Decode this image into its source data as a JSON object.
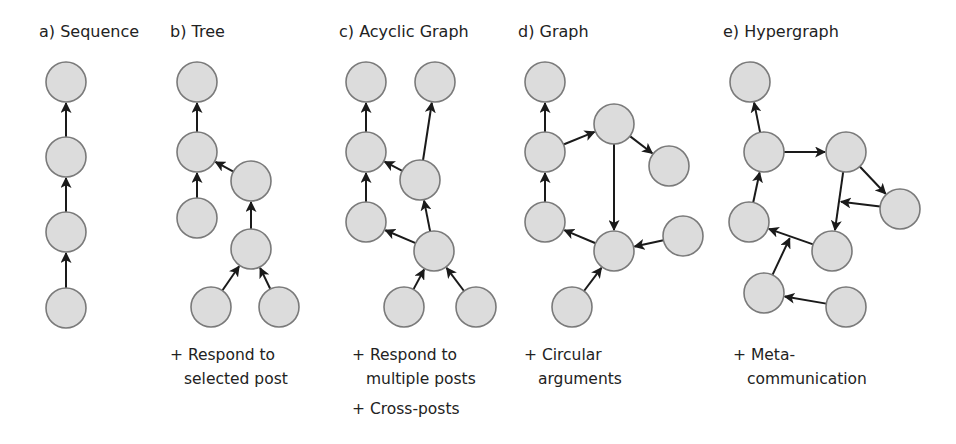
{
  "style": {
    "node_fill": "#dcdcdc",
    "node_stroke": "#7a7a7a",
    "edge_color": "#1a1a1a",
    "node_radius": 20
  },
  "panels": [
    {
      "id": "sequence",
      "title": "a) Sequence",
      "title_x": 39,
      "notes": [],
      "nodes": [
        [
          66,
          82
        ],
        [
          66,
          157
        ],
        [
          66,
          232
        ],
        [
          66,
          308
        ]
      ],
      "edges": [
        [
          1,
          0
        ],
        [
          2,
          1
        ],
        [
          3,
          2
        ]
      ],
      "meta_edges": []
    },
    {
      "id": "tree",
      "title": "b) Tree",
      "title_x": 170,
      "notes": [
        {
          "x": 170,
          "y": 343,
          "lines": [
            "+ Respond to",
            "selected post"
          ]
        }
      ],
      "nodes": [
        [
          197,
          82
        ],
        [
          197,
          152
        ],
        [
          197,
          218
        ],
        [
          251,
          181
        ],
        [
          251,
          249
        ],
        [
          211,
          307
        ],
        [
          279,
          307
        ]
      ],
      "edges": [
        [
          1,
          0
        ],
        [
          2,
          1
        ],
        [
          3,
          1
        ],
        [
          4,
          3
        ],
        [
          5,
          4
        ],
        [
          6,
          4
        ]
      ],
      "meta_edges": []
    },
    {
      "id": "acyclic-graph",
      "title": "c) Acyclic Graph",
      "title_x": 339,
      "notes": [
        {
          "x": 352,
          "y": 343,
          "lines": [
            "+ Respond to",
            "multiple posts"
          ]
        },
        {
          "x": 352,
          "y": 397,
          "lines": [
            "+ Cross-posts"
          ]
        }
      ],
      "nodes": [
        [
          366,
          82
        ],
        [
          435,
          82
        ],
        [
          366,
          152
        ],
        [
          420,
          180
        ],
        [
          366,
          222
        ],
        [
          434,
          251
        ],
        [
          404,
          307
        ],
        [
          476,
          307
        ]
      ],
      "edges": [
        [
          2,
          0
        ],
        [
          3,
          1
        ],
        [
          3,
          2
        ],
        [
          4,
          2
        ],
        [
          5,
          3
        ],
        [
          5,
          4
        ],
        [
          6,
          5
        ],
        [
          7,
          5
        ]
      ],
      "meta_edges": []
    },
    {
      "id": "graph",
      "title": "d) Graph",
      "title_x": 518,
      "notes": [
        {
          "x": 524,
          "y": 343,
          "lines": [
            "+ Circular",
            "arguments"
          ]
        }
      ],
      "nodes": [
        [
          545,
          82
        ],
        [
          545,
          152
        ],
        [
          614,
          124
        ],
        [
          669,
          166
        ],
        [
          545,
          222
        ],
        [
          614,
          251
        ],
        [
          683,
          236
        ],
        [
          572,
          307
        ]
      ],
      "edges": [
        [
          1,
          0
        ],
        [
          1,
          2
        ],
        [
          2,
          3
        ],
        [
          2,
          5
        ],
        [
          4,
          1
        ],
        [
          5,
          4
        ],
        [
          6,
          5
        ],
        [
          7,
          5
        ]
      ],
      "meta_edges": []
    },
    {
      "id": "hypergraph",
      "title": "e) Hypergraph",
      "title_x": 723,
      "notes": [
        {
          "x": 733,
          "y": 343,
          "lines": [
            "+ Meta-",
            "communication"
          ]
        }
      ],
      "nodes": [
        [
          750,
          82
        ],
        [
          764,
          152
        ],
        [
          846,
          152
        ],
        [
          900,
          209
        ],
        [
          749,
          222
        ],
        [
          832,
          251
        ],
        [
          764,
          293
        ],
        [
          846,
          307
        ]
      ],
      "edges": [
        [
          1,
          0
        ],
        [
          1,
          2
        ],
        [
          2,
          3
        ],
        [
          2,
          5
        ],
        [
          4,
          1
        ],
        [
          5,
          4
        ],
        [
          7,
          6
        ]
      ],
      "meta_edges": [
        {
          "from": 3,
          "to_edge": [
            2,
            5
          ],
          "t": 0.5
        },
        {
          "from": 6,
          "to_edge": [
            5,
            4
          ],
          "t": 0.5
        }
      ]
    }
  ]
}
